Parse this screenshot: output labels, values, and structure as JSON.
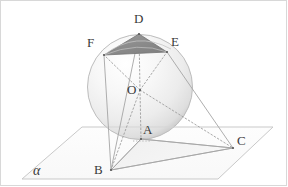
{
  "figure": {
    "type": "solid-geometry-diagram",
    "background_color": "#ffffff",
    "plane": {
      "label": "α",
      "label_x": 34,
      "label_y": 166,
      "fill_color": "#fcfcfc",
      "stroke_color": "#c9c9c9",
      "corners": [
        {
          "x": 82,
          "y": 127
        },
        {
          "x": 273,
          "y": 127
        },
        {
          "x": 218,
          "y": 179
        },
        {
          "x": 22,
          "y": 179
        }
      ]
    },
    "sphere": {
      "center_x": 140,
      "center_y": 87,
      "radius": 52.5,
      "fill_light": "#fdfdfd",
      "fill_mid": "#eeeeee",
      "fill_dark": "#c9c9c9",
      "stroke_color": "#b8b8b8"
    },
    "shaded_triangle": {
      "name": "triangle-DEF",
      "fill_color": "#8c8c8c",
      "stroke_color": "#6e6e6e",
      "vertices": [
        "D",
        "E",
        "F"
      ]
    },
    "base_triangle": {
      "name": "triangle-ABC",
      "fill_color": "#f2f2f2",
      "stroke_color": "#a8a8a8",
      "vertices": [
        "B",
        "A",
        "C"
      ]
    },
    "points": [
      {
        "id": "D",
        "label": "D",
        "x": 139,
        "y": 34,
        "label_x": 134,
        "label_y": 14
      },
      {
        "id": "E",
        "label": "E",
        "x": 167,
        "y": 52,
        "label_x": 172,
        "label_y": 40
      },
      {
        "id": "F",
        "label": "F",
        "x": 104,
        "y": 55,
        "label_x": 88,
        "label_y": 40
      },
      {
        "id": "O",
        "label": "O",
        "x": 140,
        "y": 90,
        "label_x": 129,
        "label_y": 84
      },
      {
        "id": "A",
        "label": "A",
        "x": 141,
        "y": 139,
        "label_x": 144,
        "label_y": 125
      },
      {
        "id": "B",
        "label": "B",
        "x": 111,
        "y": 170,
        "label_x": 96,
        "label_y": 163
      },
      {
        "id": "C",
        "label": "C",
        "x": 233,
        "y": 148,
        "label_x": 238,
        "label_y": 136
      }
    ],
    "dotted_segments": [
      {
        "from": "O",
        "to": "D"
      },
      {
        "from": "O",
        "to": "E"
      },
      {
        "from": "O",
        "to": "F"
      },
      {
        "from": "O",
        "to": "A"
      },
      {
        "from": "O",
        "to": "C"
      },
      {
        "from": "O",
        "to": "B"
      }
    ],
    "solid_segments": [
      {
        "from": "B",
        "to": "A"
      },
      {
        "from": "B",
        "to": "C"
      },
      {
        "from": "A",
        "to": "C"
      },
      {
        "from": "B",
        "to": "D"
      },
      {
        "from": "C",
        "to": "E"
      },
      {
        "from": "B",
        "to": "F"
      },
      {
        "from": "D",
        "to": "E"
      },
      {
        "from": "E",
        "to": "F"
      },
      {
        "from": "F",
        "to": "D"
      }
    ]
  }
}
